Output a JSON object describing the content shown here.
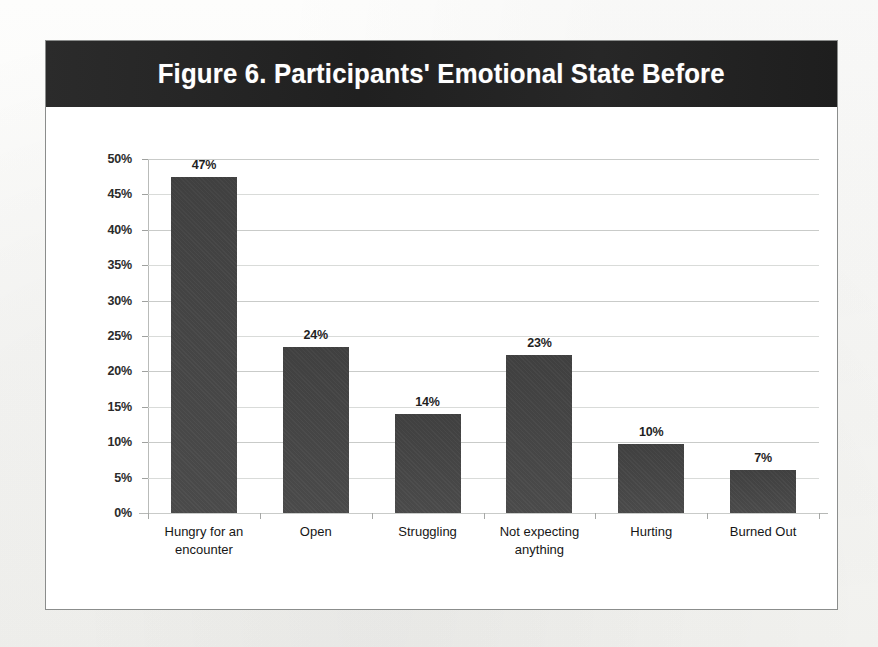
{
  "figure": {
    "title": "Figure 6. Participants' Emotional State Before",
    "header_bg": "#262626",
    "title_color": "#ffffff",
    "frame_border": "#8b8d8c",
    "plot_bg": "#ffffff"
  },
  "chart_data": {
    "type": "bar",
    "title": "Figure 6. Participants' Emotional State Before",
    "xlabel": "",
    "ylabel": "",
    "categories": [
      "Hungry for an encounter",
      "Open",
      "Struggling",
      "Not expecting anything",
      "Hurting",
      "Burned Out"
    ],
    "category_lines": [
      [
        "Hungry for an",
        "encounter"
      ],
      [
        "Open"
      ],
      [
        "Struggling"
      ],
      [
        "Not expecting",
        "anything"
      ],
      [
        "Hurting"
      ],
      [
        "Burned Out"
      ]
    ],
    "values": [
      47,
      24,
      14,
      23,
      10,
      7
    ],
    "bar_heights": [
      47.5,
      23.5,
      14.0,
      22.3,
      9.8,
      6.1
    ],
    "data_labels": [
      "47%",
      "24%",
      "14%",
      "23%",
      "10%",
      "7%"
    ],
    "ylim": [
      0,
      50
    ],
    "ytick_values": [
      0,
      5,
      10,
      15,
      20,
      25,
      30,
      35,
      40,
      45,
      50
    ],
    "ytick_labels": [
      "0%",
      "5%",
      "10%",
      "15%",
      "20%",
      "25%",
      "30%",
      "35%",
      "40%",
      "45%",
      "50%"
    ],
    "grid": true,
    "legend": false,
    "bar_color": "#434343",
    "gridline_color": "#c9cbc9"
  }
}
